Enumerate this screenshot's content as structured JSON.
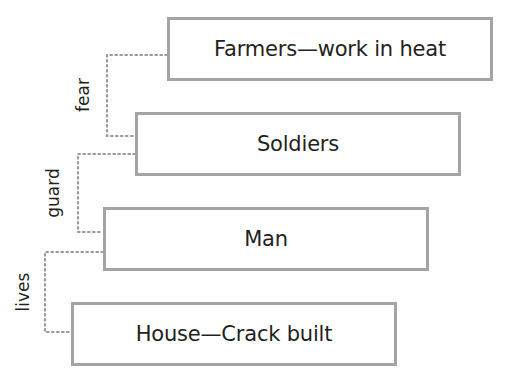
{
  "diagram": {
    "type": "stepped hierarchy / chain of relations",
    "nodes": [
      {
        "id": "farmers",
        "label": "Farmers—work in heat"
      },
      {
        "id": "soldiers",
        "label": "Soldiers"
      },
      {
        "id": "man",
        "label": "Man"
      },
      {
        "id": "house",
        "label": "House—Crack built"
      }
    ],
    "edges": [
      {
        "from": "soldiers",
        "to": "farmers",
        "label": "fear"
      },
      {
        "from": "man",
        "to": "soldiers",
        "label": "guard"
      },
      {
        "from": "house",
        "to": "man",
        "label": "lives"
      }
    ],
    "colors": {
      "box_border": "#a4a4a4",
      "connector": "#9a9a9a",
      "text": "#231f20",
      "background": "#ffffff"
    }
  }
}
